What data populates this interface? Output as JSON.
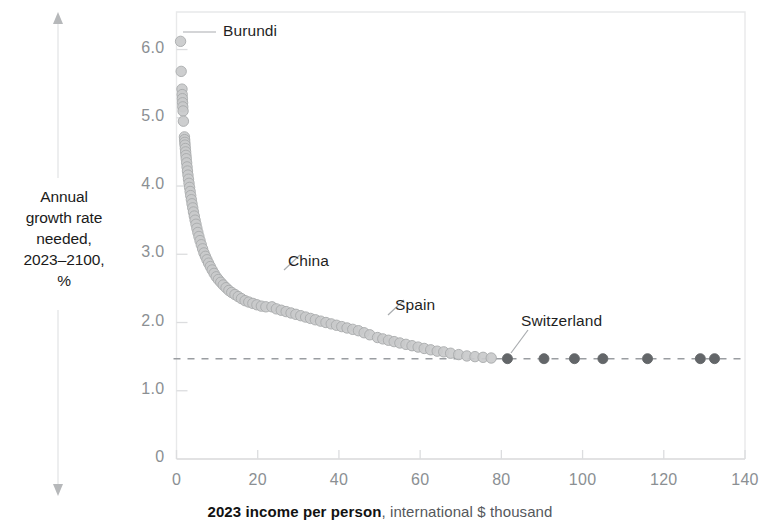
{
  "chart_data": {
    "type": "scatter",
    "title": "",
    "xlabel_bold": "2023 income per person",
    "xlabel_rest": ", international $ thousand",
    "ylabel": "Annual growth rate needed, 2023–2100, %",
    "ylabel_lines": [
      "Annual",
      "growth rate",
      "needed,",
      "2023–2100,",
      "%"
    ],
    "xlim": [
      0,
      140
    ],
    "ylim": [
      0,
      6.55
    ],
    "xticks": [
      0,
      20,
      40,
      60,
      80,
      100,
      120,
      140
    ],
    "xtick_labels": [
      "0",
      "20",
      "40",
      "60",
      "80",
      "100",
      "120",
      "140"
    ],
    "yticks": [
      0,
      1.0,
      2.0,
      3.0,
      4.0,
      5.0,
      6.0
    ],
    "ytick_labels": [
      "0",
      "1.0",
      "2.0",
      "3.0",
      "4.0",
      "5.0",
      "6.0"
    ],
    "grid": false,
    "legend": "none",
    "reference_line": {
      "y": 1.47,
      "style": "dashed",
      "color": "#9a9da1"
    },
    "marker_color_light": "#c9cacb",
    "marker_edge_light": "#a8aaac",
    "marker_color_dark": "#636669",
    "annotations": [
      {
        "label": "Burundi",
        "x": 1.0,
        "y": 6.12,
        "text_x": 223,
        "text_y": 22
      },
      {
        "label": "China",
        "x": 23.5,
        "y": 2.23,
        "text_x": 288,
        "text_y": 252
      },
      {
        "label": "Spain",
        "x": 49.5,
        "y": 1.78,
        "text_x": 395,
        "text_y": 296
      },
      {
        "label": "Switzerland",
        "x": 81.5,
        "y": 1.47,
        "text_x": 521,
        "text_y": 312
      }
    ],
    "points": [
      {
        "x": 1.0,
        "y": 6.12,
        "d": 0
      },
      {
        "x": 1.15,
        "y": 5.68,
        "d": 0
      },
      {
        "x": 1.35,
        "y": 5.42,
        "d": 0
      },
      {
        "x": 1.4,
        "y": 5.34,
        "d": 0
      },
      {
        "x": 1.45,
        "y": 5.28,
        "d": 0
      },
      {
        "x": 1.5,
        "y": 5.22,
        "d": 0
      },
      {
        "x": 1.55,
        "y": 5.16,
        "d": 0
      },
      {
        "x": 1.62,
        "y": 5.1,
        "d": 0
      },
      {
        "x": 1.7,
        "y": 4.95,
        "d": 0
      },
      {
        "x": 1.95,
        "y": 4.72,
        "d": 0
      },
      {
        "x": 2.0,
        "y": 4.68,
        "d": 0
      },
      {
        "x": 2.05,
        "y": 4.64,
        "d": 0
      },
      {
        "x": 2.1,
        "y": 4.6,
        "d": 0
      },
      {
        "x": 2.18,
        "y": 4.55,
        "d": 0
      },
      {
        "x": 2.25,
        "y": 4.5,
        "d": 0
      },
      {
        "x": 2.32,
        "y": 4.45,
        "d": 0
      },
      {
        "x": 2.4,
        "y": 4.4,
        "d": 0
      },
      {
        "x": 2.5,
        "y": 4.34,
        "d": 0
      },
      {
        "x": 2.6,
        "y": 4.28,
        "d": 0
      },
      {
        "x": 2.7,
        "y": 4.22,
        "d": 0
      },
      {
        "x": 2.82,
        "y": 4.16,
        "d": 0
      },
      {
        "x": 2.95,
        "y": 4.1,
        "d": 0
      },
      {
        "x": 3.08,
        "y": 4.04,
        "d": 0
      },
      {
        "x": 3.22,
        "y": 3.98,
        "d": 0
      },
      {
        "x": 3.36,
        "y": 3.92,
        "d": 0
      },
      {
        "x": 3.5,
        "y": 3.86,
        "d": 0
      },
      {
        "x": 3.66,
        "y": 3.8,
        "d": 0
      },
      {
        "x": 3.82,
        "y": 3.74,
        "d": 0
      },
      {
        "x": 4.0,
        "y": 3.68,
        "d": 0
      },
      {
        "x": 4.18,
        "y": 3.62,
        "d": 0
      },
      {
        "x": 4.38,
        "y": 3.56,
        "d": 0
      },
      {
        "x": 4.58,
        "y": 3.5,
        "d": 0
      },
      {
        "x": 4.8,
        "y": 3.44,
        "d": 0
      },
      {
        "x": 5.02,
        "y": 3.38,
        "d": 0
      },
      {
        "x": 5.26,
        "y": 3.32,
        "d": 0
      },
      {
        "x": 5.52,
        "y": 3.26,
        "d": 0
      },
      {
        "x": 5.8,
        "y": 3.2,
        "d": 0
      },
      {
        "x": 6.1,
        "y": 3.14,
        "d": 0
      },
      {
        "x": 6.42,
        "y": 3.08,
        "d": 0
      },
      {
        "x": 6.76,
        "y": 3.02,
        "d": 0
      },
      {
        "x": 7.12,
        "y": 2.97,
        "d": 0
      },
      {
        "x": 7.5,
        "y": 2.92,
        "d": 0
      },
      {
        "x": 7.9,
        "y": 2.87,
        "d": 0
      },
      {
        "x": 8.32,
        "y": 2.82,
        "d": 0
      },
      {
        "x": 8.78,
        "y": 2.77,
        "d": 0
      },
      {
        "x": 9.26,
        "y": 2.72,
        "d": 0
      },
      {
        "x": 9.78,
        "y": 2.67,
        "d": 0
      },
      {
        "x": 10.3,
        "y": 2.63,
        "d": 0
      },
      {
        "x": 10.9,
        "y": 2.59,
        "d": 0
      },
      {
        "x": 11.5,
        "y": 2.55,
        "d": 0
      },
      {
        "x": 12.2,
        "y": 2.51,
        "d": 0
      },
      {
        "x": 12.9,
        "y": 2.47,
        "d": 0
      },
      {
        "x": 13.6,
        "y": 2.44,
        "d": 0
      },
      {
        "x": 14.4,
        "y": 2.41,
        "d": 0
      },
      {
        "x": 15.2,
        "y": 2.38,
        "d": 0
      },
      {
        "x": 16.0,
        "y": 2.35,
        "d": 0
      },
      {
        "x": 16.9,
        "y": 2.32,
        "d": 0
      },
      {
        "x": 17.8,
        "y": 2.3,
        "d": 0
      },
      {
        "x": 18.8,
        "y": 2.28,
        "d": 0
      },
      {
        "x": 19.8,
        "y": 2.26,
        "d": 0
      },
      {
        "x": 20.9,
        "y": 2.24,
        "d": 0
      },
      {
        "x": 22.0,
        "y": 2.23,
        "d": 0
      },
      {
        "x": 23.5,
        "y": 2.23,
        "d": 0
      },
      {
        "x": 24.6,
        "y": 2.2,
        "d": 0
      },
      {
        "x": 25.8,
        "y": 2.18,
        "d": 0
      },
      {
        "x": 27.0,
        "y": 2.16,
        "d": 0
      },
      {
        "x": 28.2,
        "y": 2.14,
        "d": 0
      },
      {
        "x": 29.4,
        "y": 2.12,
        "d": 0
      },
      {
        "x": 30.6,
        "y": 2.1,
        "d": 0
      },
      {
        "x": 31.8,
        "y": 2.08,
        "d": 0
      },
      {
        "x": 33.0,
        "y": 2.06,
        "d": 0
      },
      {
        "x": 34.2,
        "y": 2.04,
        "d": 0
      },
      {
        "x": 35.5,
        "y": 2.02,
        "d": 0
      },
      {
        "x": 36.8,
        "y": 2.0,
        "d": 0
      },
      {
        "x": 38.1,
        "y": 1.98,
        "d": 0
      },
      {
        "x": 39.4,
        "y": 1.96,
        "d": 0
      },
      {
        "x": 40.7,
        "y": 1.94,
        "d": 0
      },
      {
        "x": 42.0,
        "y": 1.92,
        "d": 0
      },
      {
        "x": 43.4,
        "y": 1.9,
        "d": 0
      },
      {
        "x": 44.8,
        "y": 1.88,
        "d": 0
      },
      {
        "x": 46.2,
        "y": 1.85,
        "d": 0
      },
      {
        "x": 47.6,
        "y": 1.82,
        "d": 0
      },
      {
        "x": 49.5,
        "y": 1.78,
        "d": 0
      },
      {
        "x": 50.8,
        "y": 1.76,
        "d": 0
      },
      {
        "x": 52.2,
        "y": 1.74,
        "d": 0
      },
      {
        "x": 53.6,
        "y": 1.72,
        "d": 0
      },
      {
        "x": 55.0,
        "y": 1.7,
        "d": 0
      },
      {
        "x": 56.5,
        "y": 1.68,
        "d": 0
      },
      {
        "x": 58.0,
        "y": 1.66,
        "d": 0
      },
      {
        "x": 59.5,
        "y": 1.64,
        "d": 0
      },
      {
        "x": 61.0,
        "y": 1.62,
        "d": 0
      },
      {
        "x": 62.6,
        "y": 1.6,
        "d": 0
      },
      {
        "x": 64.2,
        "y": 1.58,
        "d": 0
      },
      {
        "x": 65.8,
        "y": 1.57,
        "d": 0
      },
      {
        "x": 67.5,
        "y": 1.55,
        "d": 0
      },
      {
        "x": 69.5,
        "y": 1.53,
        "d": 0
      },
      {
        "x": 71.5,
        "y": 1.51,
        "d": 0
      },
      {
        "x": 73.5,
        "y": 1.5,
        "d": 0
      },
      {
        "x": 75.5,
        "y": 1.49,
        "d": 0
      },
      {
        "x": 77.5,
        "y": 1.48,
        "d": 0
      },
      {
        "x": 81.5,
        "y": 1.47,
        "d": 1
      },
      {
        "x": 90.5,
        "y": 1.47,
        "d": 1
      },
      {
        "x": 98.0,
        "y": 1.47,
        "d": 1
      },
      {
        "x": 105.0,
        "y": 1.47,
        "d": 1
      },
      {
        "x": 116.0,
        "y": 1.47,
        "d": 1
      },
      {
        "x": 129.0,
        "y": 1.47,
        "d": 1
      },
      {
        "x": 132.5,
        "y": 1.47,
        "d": 1
      }
    ]
  }
}
